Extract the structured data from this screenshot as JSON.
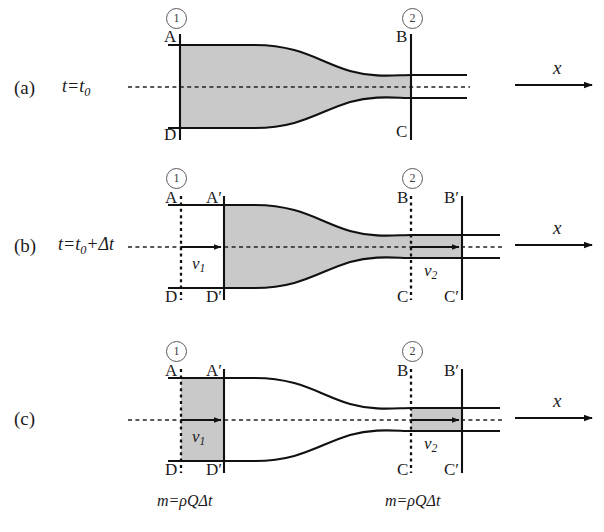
{
  "figure": {
    "colors": {
      "fluid_fill": "#c9c9c9",
      "tube_outline": "#111111",
      "axis_line": "#111111",
      "dashed_line": "#222222",
      "circle_number": "#3a3a3a",
      "background": "#ffffff"
    }
  },
  "panels": [
    {
      "tag": "(a)",
      "time_label": "t=t0",
      "time_label_parts": {
        "lead": "t",
        "eq": "=",
        "base": "t",
        "sub": "0"
      },
      "station_numbers": [
        "1",
        "2"
      ],
      "point_labels": [
        "A",
        "B",
        "C",
        "D"
      ],
      "axis_label": "x",
      "velocity_labels": [],
      "mass_labels": []
    },
    {
      "tag": "(b)",
      "time_label": "t=t0+Δt",
      "time_label_parts": {
        "lead": "t",
        "eq": "=",
        "base": "t",
        "sub": "0",
        "plus": "+",
        "delta": "Δt"
      },
      "station_numbers": [
        "1",
        "2"
      ],
      "point_labels": [
        "A",
        "A′",
        "B",
        "B′",
        "C",
        "C′",
        "D",
        "D′"
      ],
      "axis_label": "x",
      "velocity_labels": [
        "v1",
        "v2"
      ],
      "velocity_label_parts": [
        {
          "base": "v",
          "sub": "1"
        },
        {
          "base": "v",
          "sub": "2"
        }
      ],
      "mass_labels": []
    },
    {
      "tag": "(c)",
      "time_label": "",
      "station_numbers": [
        "1",
        "2"
      ],
      "point_labels": [
        "A",
        "A′",
        "B",
        "B′",
        "C",
        "C′",
        "D",
        "D′"
      ],
      "axis_label": "x",
      "velocity_labels": [
        "v1",
        "v2"
      ],
      "velocity_label_parts": [
        {
          "base": "v",
          "sub": "1"
        },
        {
          "base": "v",
          "sub": "2"
        }
      ],
      "mass_labels": [
        "m=ρQΔt",
        "m=ρQΔt"
      ],
      "mass_label_parts": {
        "m": "m",
        "eq": "=",
        "rho": "ρ",
        "Q": "Q",
        "deltat": "Δt"
      }
    }
  ],
  "text": {
    "tag_a": "(a)",
    "tag_b": "(b)",
    "tag_c": "(c)",
    "t_letter": "t",
    "equals": "=",
    "t0_base": "t",
    "t0_sub": "0",
    "plus": "+",
    "delta_t": "Δt",
    "station_one": "1",
    "station_two": "2",
    "A": "A",
    "Aprime": "A′",
    "B": "B",
    "Bprime": "B′",
    "C": "C",
    "Cprime": "C′",
    "D": "D",
    "Dprime": "D′",
    "v_base": "v",
    "v1_sub": "1",
    "v2_sub": "2",
    "x_axis": "x",
    "mass_m": "m",
    "mass_rho": "ρ",
    "mass_Q": "Q",
    "mass_dt": "Δt"
  }
}
